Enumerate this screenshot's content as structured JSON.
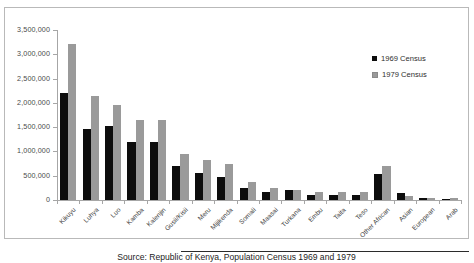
{
  "chart_data": {
    "type": "bar",
    "title": "",
    "xlabel": "",
    "ylabel": "",
    "ylim": [
      0,
      3500000
    ],
    "ytick_values": [
      0,
      500000,
      1000000,
      1500000,
      2000000,
      2500000,
      3000000,
      3500000
    ],
    "ytick_labels": [
      "0",
      "500,000",
      "1,000,000",
      "1,500,000",
      "2,000,000",
      "2,500,000",
      "3,000,000",
      "3,500,000"
    ],
    "grid": false,
    "legend_position": "upper right",
    "categories": [
      "Kikuyu",
      "Luhya",
      "Luo",
      "Kamba",
      "Kalenjin",
      "Gusii/Kisii",
      "Meru",
      "Mijikenda",
      "Somali",
      "Maasai",
      "Turkana",
      "Embu",
      "Taita",
      "Teso",
      "Other African",
      "Asian",
      "European",
      "Arab"
    ],
    "series": [
      {
        "name": "1969 Census",
        "color": "#0d0d0d",
        "values": [
          2201632,
          1453302,
          1521595,
          1197712,
          1197712,
          701679,
          554256,
          470000,
          250000,
          154906,
          203177,
          110000,
          110000,
          110000,
          540000,
          139037,
          40593,
          27886
        ]
      },
      {
        "name": "1979 Census",
        "color": "#9a9a9a",
        "values": [
          3202000,
          2143000,
          1956000,
          1645000,
          1652000,
          940000,
          830000,
          734000,
          374000,
          241000,
          203000,
          158000,
          159000,
          156000,
          700000,
          78600,
          39900,
          39000
        ]
      }
    ]
  },
  "legend": {
    "items": [
      {
        "label": "1969 Census",
        "swatch": "black"
      },
      {
        "label": "1979 Census",
        "swatch": "gray"
      }
    ]
  },
  "caption": {
    "text": "Source: Republic of Kenya, Population Census 1969 and 1979"
  }
}
